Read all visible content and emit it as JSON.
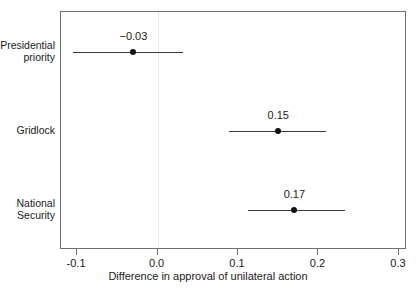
{
  "chart_data": {
    "type": "scatter",
    "title": "",
    "xlabel": "Difference in approval of unilateral action",
    "ylabel": "",
    "xlim": [
      -0.12,
      0.31
    ],
    "xticks": [
      -0.1,
      0.0,
      0.1,
      0.2,
      0.3
    ],
    "xticklabels": [
      "-0.1",
      "0.0",
      "0.1",
      "0.2",
      "0.3"
    ],
    "grid": false,
    "legend": "none",
    "reference_line": {
      "x": 0.0,
      "style": "dotted",
      "color": "#e2d9cf"
    },
    "categories": [
      "Presidential\npriority",
      "Gridlock",
      "National\nSecurity"
    ],
    "points": [
      {
        "label": "Presidential\npriority",
        "estimate": -0.03,
        "estimate_label": "−0.03",
        "ci_low": -0.105,
        "ci_high": 0.032
      },
      {
        "label": "Gridlock",
        "estimate": 0.15,
        "estimate_label": "0.15",
        "ci_low": 0.089,
        "ci_high": 0.209
      },
      {
        "label": "National\nSecurity",
        "estimate": 0.17,
        "estimate_label": "0.17",
        "ci_low": 0.112,
        "ci_high": 0.233
      }
    ]
  },
  "axis": {
    "x_title": "Difference in approval of unilateral action",
    "tick_0": "-0.1",
    "tick_1": "0.0",
    "tick_2": "0.1",
    "tick_3": "0.2",
    "tick_4": "0.3"
  },
  "rows": {
    "row_0_label": "Presidential\npriority",
    "row_0_value": "−0.03",
    "row_1_label": "Gridlock",
    "row_1_value": "0.15",
    "row_2_label": "National\nSecurity",
    "row_2_value": "0.17"
  },
  "colors": {
    "point": "#111111",
    "errorbar": "#3a3a3a",
    "frame": "#6f6f6f",
    "reference": "#e2d9cf",
    "background": "#ffffff"
  }
}
